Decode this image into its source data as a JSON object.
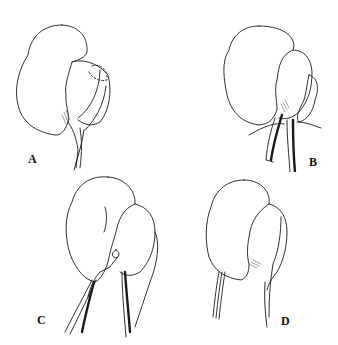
{
  "figure": {
    "panels": [
      {
        "id": "A",
        "label": "A",
        "description": "Kidney with upper pole dashed outline and vessels at hilum"
      },
      {
        "id": "B",
        "label": "B",
        "description": "Kidney with ureter and vessels dissected, dark vessel segment"
      },
      {
        "id": "C",
        "label": "C",
        "description": "Kidney with ligated vessel and hatched ureter"
      },
      {
        "id": "D",
        "label": "D",
        "description": "Kidney with hatched ureter and thin vessels below"
      }
    ]
  }
}
